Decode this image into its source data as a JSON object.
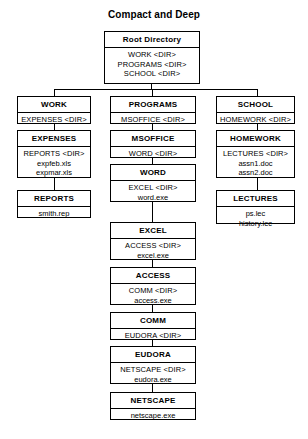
{
  "title": "Compact and Deep",
  "diagram": {
    "type": "tree",
    "root": {
      "id": "root-directory",
      "title": "Root Directory",
      "entries": [
        {
          "text": "WORK <DIR>",
          "kind": "dir"
        },
        {
          "text": "PROGRAMS <DIR>",
          "kind": "dir"
        },
        {
          "text": "SCHOOL <DIR>",
          "kind": "dir"
        }
      ]
    },
    "columns": [
      {
        "id": "work-column",
        "nodes": [
          {
            "id": "work",
            "title": "WORK",
            "entries": [
              {
                "text": "EXPENSES <DIR>",
                "kind": "dir"
              }
            ]
          },
          {
            "id": "expenses",
            "title": "EXPENSES",
            "entries": [
              {
                "text": "REPORTS <DIR>",
                "kind": "dir"
              },
              {
                "text": "expfeb.xls",
                "kind": "file"
              },
              {
                "text": "expmar.xls",
                "kind": "file"
              }
            ]
          },
          {
            "id": "reports",
            "title": "REPORTS",
            "entries": [
              {
                "text": "smith.rep",
                "kind": "file"
              }
            ]
          }
        ]
      },
      {
        "id": "programs-column",
        "nodes": [
          {
            "id": "programs",
            "title": "PROGRAMS",
            "entries": [
              {
                "text": "MSOFFICE <DIR>",
                "kind": "dir"
              }
            ]
          },
          {
            "id": "msoffice",
            "title": "MSOFFICE",
            "entries": [
              {
                "text": "WORD <DIR>",
                "kind": "dir"
              }
            ]
          },
          {
            "id": "word",
            "title": "WORD",
            "entries": [
              {
                "text": "EXCEL <DIR>",
                "kind": "dir"
              },
              {
                "text": "word.exe",
                "kind": "file"
              }
            ]
          },
          {
            "id": "excel",
            "title": "EXCEL",
            "entries": [
              {
                "text": "ACCESS <DIR>",
                "kind": "dir"
              },
              {
                "text": "excel.exe",
                "kind": "file"
              }
            ]
          },
          {
            "id": "access",
            "title": "ACCESS",
            "entries": [
              {
                "text": "COMM <DIR>",
                "kind": "dir"
              },
              {
                "text": "access.exe",
                "kind": "file"
              }
            ]
          },
          {
            "id": "comm",
            "title": "COMM",
            "entries": [
              {
                "text": "EUDORA <DIR>",
                "kind": "dir"
              }
            ]
          },
          {
            "id": "eudora",
            "title": "EUDORA",
            "entries": [
              {
                "text": "NETSCAPE <DIR>",
                "kind": "dir"
              },
              {
                "text": "eudora.exe",
                "kind": "file"
              }
            ]
          },
          {
            "id": "netscape",
            "title": "NETSCAPE",
            "entries": [
              {
                "text": "netscape.exe",
                "kind": "file"
              }
            ]
          }
        ]
      },
      {
        "id": "school-column",
        "nodes": [
          {
            "id": "school",
            "title": "SCHOOL",
            "entries": [
              {
                "text": "HOMEWORK <DIR>",
                "kind": "dir"
              }
            ]
          },
          {
            "id": "homework",
            "title": "HOMEWORK",
            "entries": [
              {
                "text": "LECTURES <DIR>",
                "kind": "dir"
              },
              {
                "text": "assn1.doc",
                "kind": "file"
              },
              {
                "text": "assn2.doc",
                "kind": "file"
              }
            ]
          },
          {
            "id": "lectures",
            "title": "LECTURES",
            "entries": [
              {
                "text": "ps.lec",
                "kind": "file"
              },
              {
                "text": "history.lec",
                "kind": "file"
              }
            ]
          }
        ]
      }
    ]
  },
  "layout": {
    "boxes": {
      "root-directory": {
        "x": 104,
        "y": 31,
        "w": 96,
        "h": 53
      },
      "work": {
        "x": 17,
        "y": 96,
        "w": 74,
        "h": 28
      },
      "expenses": {
        "x": 17,
        "y": 130,
        "w": 74,
        "h": 48
      },
      "reports": {
        "x": 17,
        "y": 190,
        "w": 74,
        "h": 28
      },
      "programs": {
        "x": 110,
        "y": 96,
        "w": 86,
        "h": 28
      },
      "msoffice": {
        "x": 110,
        "y": 130,
        "w": 86,
        "h": 28
      },
      "word": {
        "x": 110,
        "y": 164,
        "w": 86,
        "h": 38
      },
      "excel": {
        "x": 110,
        "y": 222,
        "w": 86,
        "h": 38
      },
      "access": {
        "x": 110,
        "y": 267,
        "w": 86,
        "h": 38
      },
      "comm": {
        "x": 110,
        "y": 312,
        "w": 86,
        "h": 28
      },
      "eudora": {
        "x": 110,
        "y": 346,
        "w": 86,
        "h": 38
      },
      "netscape": {
        "x": 110,
        "y": 392,
        "w": 86,
        "h": 28
      },
      "school": {
        "x": 216,
        "y": 96,
        "w": 79,
        "h": 28
      },
      "homework": {
        "x": 216,
        "y": 130,
        "w": 79,
        "h": 48
      },
      "lectures": {
        "x": 216,
        "y": 190,
        "w": 79,
        "h": 34
      }
    },
    "connectors": {
      "root_stem": {
        "x": 151,
        "y": 84,
        "w": 1,
        "h": 6
      },
      "root_bus": {
        "x": 54,
        "y": 89,
        "w": 204,
        "h": 1
      },
      "drop_work": {
        "x": 54,
        "y": 89,
        "w": 1,
        "h": 7
      },
      "drop_programs": {
        "x": 152,
        "y": 89,
        "w": 1,
        "h": 7
      },
      "drop_school": {
        "x": 257,
        "y": 89,
        "w": 1,
        "h": 7
      },
      "work_e": {
        "x": 54,
        "y": 124,
        "w": 1,
        "h": 6
      },
      "exp_rep": {
        "x": 54,
        "y": 178,
        "w": 1,
        "h": 12
      },
      "prog_ms": {
        "x": 152,
        "y": 124,
        "w": 1,
        "h": 6
      },
      "ms_word": {
        "x": 152,
        "y": 158,
        "w": 1,
        "h": 6
      },
      "word_excel": {
        "x": 152,
        "y": 202,
        "w": 1,
        "h": 20
      },
      "excel_access": {
        "x": 152,
        "y": 260,
        "w": 1,
        "h": 7
      },
      "access_comm": {
        "x": 152,
        "y": 305,
        "w": 1,
        "h": 7
      },
      "comm_eudora": {
        "x": 152,
        "y": 340,
        "w": 1,
        "h": 6
      },
      "eudora_net": {
        "x": 152,
        "y": 384,
        "w": 1,
        "h": 8
      },
      "school_hw": {
        "x": 257,
        "y": 124,
        "w": 1,
        "h": 6
      },
      "hw_lect": {
        "x": 257,
        "y": 178,
        "w": 1,
        "h": 12
      }
    }
  }
}
